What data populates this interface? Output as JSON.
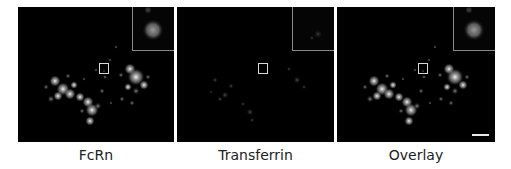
{
  "figure": {
    "panels": [
      {
        "id": "fcrn",
        "label": "FcRn",
        "channel_brightness": 1.0,
        "has_scale_bar": false
      },
      {
        "id": "transferrin",
        "label": "Transferrin",
        "channel_brightness": 0.22,
        "has_scale_bar": false
      },
      {
        "id": "overlay",
        "label": "Overlay",
        "channel_brightness": 1.0,
        "has_scale_bar": true
      }
    ],
    "colors": {
      "background": "#ffffff",
      "panel_background": "#000000",
      "signal": "#ffffff",
      "inset_border": "#8a8a8a",
      "roi_box": "#d8d8d8",
      "scale_bar": "#e8e8e8",
      "label_text": "#222222"
    }
  }
}
